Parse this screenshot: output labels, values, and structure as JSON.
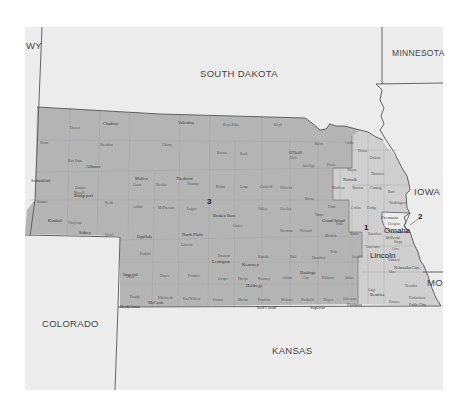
{
  "map": {
    "title": "Nebraska Congressional Districts",
    "colors": {
      "background": "#ffffff",
      "neighbor_states": "#ececec",
      "district_3": "#b4b4b4",
      "district_1": "#cfcfcf",
      "district_2": "#e4e4e4",
      "border": "#555555",
      "county_line": "#9a9a9a"
    },
    "neighbor_states": [
      {
        "name": "WY"
      },
      {
        "name": "SOUTH DAKOTA"
      },
      {
        "name": "MINNESOTA"
      },
      {
        "name": "IOWA"
      },
      {
        "name": "MO"
      },
      {
        "name": "KANSAS"
      },
      {
        "name": "COLORADO"
      }
    ],
    "districts": [
      {
        "number": "1"
      },
      {
        "number": "2"
      },
      {
        "number": "3"
      }
    ],
    "major_cities": [
      {
        "name": "Lincoln"
      },
      {
        "name": "Omaha"
      },
      {
        "name": "Fremont"
      },
      {
        "name": "Bellevue"
      }
    ],
    "cities": [
      {
        "name": "Chadron"
      },
      {
        "name": "Valentine"
      },
      {
        "name": "Alliance"
      },
      {
        "name": "Scottsbluff"
      },
      {
        "name": "Bridgeport"
      },
      {
        "name": "Kimball"
      },
      {
        "name": "Sidney"
      },
      {
        "name": "Ogallala"
      },
      {
        "name": "North Platte"
      },
      {
        "name": "Thedford"
      },
      {
        "name": "Mullen"
      },
      {
        "name": "Broken Bow"
      },
      {
        "name": "Lexington"
      },
      {
        "name": "Kearney"
      },
      {
        "name": "Hastings"
      },
      {
        "name": "Imperial"
      },
      {
        "name": "McCook"
      },
      {
        "name": "Holdrege"
      },
      {
        "name": "Grand Island"
      },
      {
        "name": "Norfolk"
      },
      {
        "name": "O'Neill"
      },
      {
        "name": "Beatrice"
      },
      {
        "name": "Nebraska City"
      },
      {
        "name": "Falls City"
      },
      {
        "name": "Superior"
      },
      {
        "name": "Fairbury"
      },
      {
        "name": "Benkelman"
      },
      {
        "name": "Red Cloud"
      }
    ],
    "counties": [
      {
        "name": "Sioux"
      },
      {
        "name": "Dawes"
      },
      {
        "name": "Sheridan"
      },
      {
        "name": "Cherry"
      },
      {
        "name": "Keya Paha"
      },
      {
        "name": "Boyd"
      },
      {
        "name": "Box Butte"
      },
      {
        "name": "Brown"
      },
      {
        "name": "Rock"
      },
      {
        "name": "Holt"
      },
      {
        "name": "Knox"
      },
      {
        "name": "Cedar"
      },
      {
        "name": "Dixon"
      },
      {
        "name": "Dakota"
      },
      {
        "name": "Antelope"
      },
      {
        "name": "Pierce"
      },
      {
        "name": "Wayne"
      },
      {
        "name": "Thurston"
      },
      {
        "name": "Madison"
      },
      {
        "name": "Stanton"
      },
      {
        "name": "Cuming"
      },
      {
        "name": "Burt"
      },
      {
        "name": "Garden"
      },
      {
        "name": "Grant"
      },
      {
        "name": "Hooker"
      },
      {
        "name": "Thomas"
      },
      {
        "name": "Blaine"
      },
      {
        "name": "Loup"
      },
      {
        "name": "Garfield"
      },
      {
        "name": "Wheeler"
      },
      {
        "name": "Valley"
      },
      {
        "name": "Greeley"
      },
      {
        "name": "Boone"
      },
      {
        "name": "Platte"
      },
      {
        "name": "Colfax"
      },
      {
        "name": "Dodge"
      },
      {
        "name": "Washington"
      },
      {
        "name": "Douglas"
      },
      {
        "name": "Sarpy"
      },
      {
        "name": "Banner"
      },
      {
        "name": "Morrill"
      },
      {
        "name": "Cheyenne"
      },
      {
        "name": "Deuel"
      },
      {
        "name": "Keith"
      },
      {
        "name": "Arthur"
      },
      {
        "name": "McPherson"
      },
      {
        "name": "Logan"
      },
      {
        "name": "Custer"
      },
      {
        "name": "Sherman"
      },
      {
        "name": "Howard"
      },
      {
        "name": "Nance"
      },
      {
        "name": "Merrick"
      },
      {
        "name": "Polk"
      },
      {
        "name": "Butler"
      },
      {
        "name": "Saunders"
      },
      {
        "name": "Lincoln"
      },
      {
        "name": "Dawson"
      },
      {
        "name": "Buffalo"
      },
      {
        "name": "Hall"
      },
      {
        "name": "Hamilton"
      },
      {
        "name": "York"
      },
      {
        "name": "Seward"
      },
      {
        "name": "Lancaster"
      },
      {
        "name": "Cass"
      },
      {
        "name": "Otoe"
      },
      {
        "name": "Perkins"
      },
      {
        "name": "Chase"
      },
      {
        "name": "Hayes"
      },
      {
        "name": "Frontier"
      },
      {
        "name": "Gosper"
      },
      {
        "name": "Phelps"
      },
      {
        "name": "Kearney"
      },
      {
        "name": "Adams"
      },
      {
        "name": "Clay"
      },
      {
        "name": "Fillmore"
      },
      {
        "name": "Saline"
      },
      {
        "name": "Dundy"
      },
      {
        "name": "Hitchcock"
      },
      {
        "name": "Red Willow"
      },
      {
        "name": "Furnas"
      },
      {
        "name": "Harlan"
      },
      {
        "name": "Franklin"
      },
      {
        "name": "Webster"
      },
      {
        "name": "Nuckolls"
      },
      {
        "name": "Thayer"
      },
      {
        "name": "Jefferson"
      },
      {
        "name": "Gage"
      },
      {
        "name": "Johnson"
      },
      {
        "name": "Nemaha"
      },
      {
        "name": "Pawnee"
      },
      {
        "name": "Richardson"
      }
    ]
  }
}
